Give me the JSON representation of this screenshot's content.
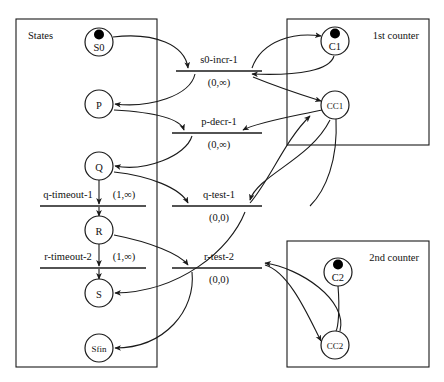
{
  "figure": {
    "type": "petri-net-diagram",
    "title": "",
    "background": "#ffffff",
    "stroke_color": "#1a1a1a",
    "token_color": "#000000",
    "width": 444,
    "height": 382
  },
  "containers": [
    {
      "id": "states-box",
      "label": "States",
      "x": 16,
      "y": 19,
      "width": 141,
      "height": 348
    },
    {
      "id": "counter1-box",
      "label": "1st counter",
      "x": 287,
      "y": 19,
      "width": 142,
      "height": 126
    },
    {
      "id": "counter2-box",
      "label": "2nd counter",
      "x": 287,
      "y": 241,
      "width": 142,
      "height": 126
    }
  ],
  "places": [
    {
      "id": "S0",
      "label": "S0",
      "cx": 99,
      "cy": 42,
      "r": 14,
      "token": true,
      "small": false
    },
    {
      "id": "P",
      "label": "P",
      "cx": 99,
      "cy": 104,
      "r": 14,
      "token": false,
      "small": false
    },
    {
      "id": "Q",
      "label": "Q",
      "cx": 99,
      "cy": 166,
      "r": 14,
      "token": false,
      "small": false
    },
    {
      "id": "R",
      "label": "R",
      "cx": 99,
      "cy": 230,
      "r": 14,
      "token": false,
      "small": false
    },
    {
      "id": "S",
      "label": "S",
      "cx": 99,
      "cy": 293,
      "r": 14,
      "token": false,
      "small": false
    },
    {
      "id": "Sfin",
      "label": "Sfin",
      "cx": 99,
      "cy": 348,
      "r": 14,
      "token": false,
      "small": true
    },
    {
      "id": "C1",
      "label": "C1",
      "cx": 335,
      "cy": 41,
      "r": 14,
      "token": true,
      "small": false
    },
    {
      "id": "CC1",
      "label": "CC1",
      "cx": 335,
      "cy": 105,
      "r": 14,
      "token": false,
      "small": true
    },
    {
      "id": "C2",
      "label": "C2",
      "cx": 338,
      "cy": 272,
      "r": 14,
      "token": true,
      "small": false
    },
    {
      "id": "CC2",
      "label": "CC2",
      "cx": 335,
      "cy": 345,
      "r": 14,
      "token": false,
      "small": true
    }
  ],
  "transitions": [
    {
      "id": "s0-incr-1",
      "name": "s0-incr-1",
      "interval": "(0,∞)",
      "guard": "",
      "x1": 176,
      "x2": 262,
      "y": 71,
      "name_x": 219,
      "name_y": 63,
      "interval_x": 219,
      "interval_y": 86
    },
    {
      "id": "p-decr-1",
      "name": "p-decr-1",
      "interval": "(0,∞)",
      "guard": "",
      "x1": 172,
      "x2": 262,
      "y": 133,
      "name_x": 219,
      "name_y": 125,
      "interval_x": 219,
      "interval_y": 148
    },
    {
      "id": "q-timeout-1",
      "name": "q-timeout-1",
      "interval": "(1,∞)",
      "guard": "",
      "x1": 40,
      "x2": 146,
      "y": 206,
      "name_x": 68,
      "name_y": 198,
      "interval_x": 124,
      "interval_y": 198
    },
    {
      "id": "q-test-1",
      "name": "q-test-1",
      "interval": "(0,0)",
      "guard": "",
      "x1": 172,
      "x2": 262,
      "y": 206,
      "name_x": 219,
      "name_y": 198,
      "interval_x": 219,
      "interval_y": 221
    },
    {
      "id": "r-timeout-2",
      "name": "r-timeout-2",
      "interval": "(1,∞)",
      "guard": "",
      "x1": 40,
      "x2": 146,
      "y": 268,
      "name_x": 68,
      "name_y": 260,
      "interval_x": 124,
      "interval_y": 260
    },
    {
      "id": "r-test-2",
      "name": "r-test-2",
      "interval": "(0,0)",
      "guard": "",
      "x1": 172,
      "x2": 262,
      "y": 268,
      "name_x": 219,
      "name_y": 260,
      "interval_x": 219,
      "interval_y": 283
    }
  ],
  "arcs": [
    {
      "id": "a1",
      "from": "S0",
      "to": "s0-incr-1",
      "path": "M 113,37 C 155,32 185,45 188,68",
      "arrow": true
    },
    {
      "id": "a2",
      "from": "s0-incr-1",
      "to": "P",
      "path": "M 195,74 C 190,96 150,108 115,104",
      "arrow": true
    },
    {
      "id": "a3",
      "from": "s0-incr-1",
      "to": "C1",
      "path": "M 252,68 C 262,40 295,32 321,36",
      "arrow": true
    },
    {
      "id": "a4",
      "from": "C1",
      "to": "s0-incr-1",
      "path": "M 334,56 C 330,70 300,76 252,74",
      "arrow": true
    },
    {
      "id": "a5",
      "from": "s0-incr-1",
      "to": "CC1",
      "path": "M 253,77 C 280,88 305,96 321,101",
      "arrow": true
    },
    {
      "id": "a6",
      "from": "P",
      "to": "p-decr-1",
      "path": "M 114,110 C 150,112 180,118 184,130",
      "arrow": true
    },
    {
      "id": "a7",
      "from": "p-decr-1",
      "to": "Q",
      "path": "M 192,136 C 186,156 145,172 115,166",
      "arrow": true
    },
    {
      "id": "a8",
      "from": "CC1",
      "to": "p-decr-1",
      "path": "M 322,110 C 295,116 258,122 243,130",
      "arrow": true
    },
    {
      "id": "a9",
      "from": "Q",
      "to": "q-test-1",
      "path": "M 114,172 C 150,176 180,188 188,203",
      "arrow": true
    },
    {
      "id": "a10",
      "from": "q-test-1",
      "to": "CC1",
      "path": "M 250,203 C 270,180 285,140 310,116",
      "arrow": true
    },
    {
      "id": "a11",
      "from": "CC1",
      "to": "q-test-1",
      "path": "M 330,120 C 310,160 258,175 250,200",
      "arrow": true
    },
    {
      "id": "a12",
      "from": "q-test-1",
      "to": "S",
      "path": "M 245,212 C 230,250 180,292 115,293",
      "arrow": true
    },
    {
      "id": "a13",
      "from": "Q",
      "to": "q-timeout-1",
      "path": "M 99,180 L 99,204",
      "arrow": true
    },
    {
      "id": "a14",
      "from": "q-timeout-1",
      "to": "R",
      "path": "M 99,207 L 99,216",
      "arrow": true
    },
    {
      "id": "a15",
      "from": "R",
      "to": "r-test-2",
      "path": "M 114,235 C 150,242 180,254 188,265",
      "arrow": true
    },
    {
      "id": "a16",
      "from": "R",
      "to": "r-timeout-2",
      "path": "M 99,244 L 99,266",
      "arrow": true
    },
    {
      "id": "a17",
      "from": "r-timeout-2",
      "to": "S",
      "path": "M 99,269 L 99,279",
      "arrow": true
    },
    {
      "id": "a18",
      "from": "r-test-2",
      "to": "CC2",
      "path": "M 265,265 C 290,272 310,320 321,341",
      "arrow": true
    },
    {
      "id": "a19",
      "from": "CC2",
      "to": "r-test-2",
      "path": "M 340,331 C 348,300 300,268 265,263",
      "arrow": true
    },
    {
      "id": "a20",
      "from": "r-test-2",
      "to": "Sfin",
      "path": "M 192,272 C 196,310 165,348 115,348",
      "arrow": true
    },
    {
      "id": "a21",
      "from": "CC1",
      "to": "CC1-loop",
      "path": "M 336,119 C 338,160 326,190 310,206",
      "arrow": false
    },
    {
      "id": "a22",
      "from": "C2",
      "to": "CC2",
      "path": "M 338,286 C 340,310 338,328 336,331",
      "arrow": false
    }
  ]
}
